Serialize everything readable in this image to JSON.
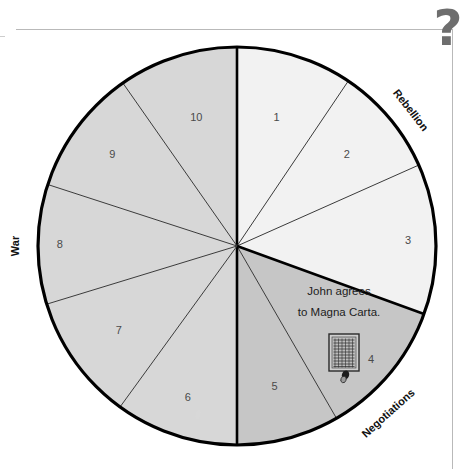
{
  "page": {
    "background_color": "#ffffff",
    "frame_color": "#b9b9b9"
  },
  "question_mark": {
    "glyph": "?",
    "color": "#6e6e6e"
  },
  "wheel": {
    "center": {
      "x": 237,
      "y": 246
    },
    "radius": 199,
    "outline_color": "#000000",
    "divider_color": "#3a3a3a",
    "fills": {
      "light": "#f2f2f2",
      "medium": "#d7d7d7",
      "dark": "#c6c6c6"
    },
    "segments": [
      {
        "number": "1",
        "start_angle": 0,
        "end_angle": 34,
        "fill": "light",
        "label_r": 0.68,
        "phase": "Rebellion"
      },
      {
        "number": "2",
        "start_angle": 34,
        "end_angle": 66,
        "fill": "light",
        "label_r": 0.72,
        "phase": "Rebellion"
      },
      {
        "number": "3",
        "start_angle": 66,
        "end_angle": 110,
        "fill": "light",
        "label_r": 0.86,
        "phase": "Rebellion"
      },
      {
        "number": "4",
        "start_angle": 110,
        "end_angle": 150,
        "fill": "dark",
        "label_r": 0.88,
        "phase": "Negotiations"
      },
      {
        "number": "5",
        "start_angle": 150,
        "end_angle": 180,
        "fill": "dark",
        "label_r": 0.73,
        "phase": "Negotiations"
      },
      {
        "number": "6",
        "start_angle": 180,
        "end_angle": 216,
        "fill": "medium",
        "label_r": 0.8,
        "phase": "War"
      },
      {
        "number": "7",
        "start_angle": 216,
        "end_angle": 253,
        "fill": "medium",
        "label_r": 0.73,
        "phase": "War"
      },
      {
        "number": "8",
        "start_angle": 253,
        "end_angle": 288,
        "fill": "medium",
        "label_r": 0.89,
        "phase": "War"
      },
      {
        "number": "9",
        "start_angle": 288,
        "end_angle": 325,
        "fill": "medium",
        "label_r": 0.78,
        "phase": "War"
      },
      {
        "number": "10",
        "start_angle": 325,
        "end_angle": 360,
        "fill": "medium",
        "label_r": 0.68,
        "phase": "War"
      }
    ],
    "thick_dividers": [
      0,
      110,
      180
    ],
    "outer_labels": [
      {
        "text": "Rebellion",
        "angle": 52,
        "radius_offset": 22,
        "rotation": 52
      },
      {
        "text": "Negotiations",
        "angle": 138,
        "radius_offset": 26,
        "rotation": -42
      },
      {
        "text": "War",
        "angle": 270,
        "radius_offset": 23,
        "rotation": -90
      }
    ]
  },
  "callout": {
    "line1": "John agrees",
    "line2": "to Magna Carta.",
    "icon": "magna-carta-charter-icon",
    "icon_position": {
      "x": 343,
      "y": 352
    }
  }
}
